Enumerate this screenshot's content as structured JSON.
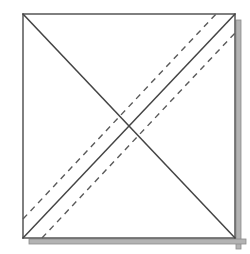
{
  "figure": {
    "name": "square-fold-diagram",
    "background_color": "#ffffff"
  },
  "canvas": {
    "width": 250,
    "height": 254
  },
  "sheet": {
    "name": "square-sheet",
    "fill_color": "#ffffff",
    "stroke_color": "#4a4a4a",
    "stroke_width": 1.4,
    "corners": {
      "top_left": {
        "x": 23,
        "y": 14
      },
      "top_right": {
        "x": 235,
        "y": 14
      },
      "bottom_right": {
        "x": 235,
        "y": 238
      },
      "bottom_left": {
        "x": 23,
        "y": 238
      }
    }
  },
  "shadow": {
    "name": "sheet-drop-shadow",
    "color": "#b3b3b3",
    "stroke_color": "#8c8c8c",
    "offset_x": 6,
    "offset_y": 6,
    "thickness": 5,
    "edges": [
      "right",
      "bottom"
    ]
  },
  "solid_lines": [
    {
      "name": "main-diagonal",
      "label": "Diagonal top-left to bottom-right",
      "from": {
        "x": 23,
        "y": 14
      },
      "to": {
        "x": 235,
        "y": 238
      },
      "color": "#444444",
      "width": 1.5,
      "style": "solid"
    },
    {
      "name": "anti-diagonal",
      "label": "Diagonal bottom-left to top-right",
      "from": {
        "x": 23,
        "y": 238
      },
      "to": {
        "x": 235,
        "y": 14
      },
      "color": "#444444",
      "width": 1.5,
      "style": "solid"
    }
  ],
  "dashed_lines": [
    {
      "name": "fold-line-upper",
      "label": "Dashed fold line above anti-diagonal",
      "from": {
        "x": 23,
        "y": 219
      },
      "to": {
        "x": 216,
        "y": 14
      },
      "color": "#5a5a5a",
      "width": 1.4,
      "style": "dashed",
      "dash_length": 6,
      "gap_length": 5,
      "offset_from_anti_diagonal": -13
    },
    {
      "name": "fold-line-lower",
      "label": "Dashed fold line below anti-diagonal",
      "from": {
        "x": 42,
        "y": 238
      },
      "to": {
        "x": 235,
        "y": 33
      },
      "color": "#5a5a5a",
      "width": 1.4,
      "style": "dashed",
      "dash_length": 6,
      "gap_length": 5,
      "offset_from_anti_diagonal": 13
    }
  ],
  "center_point": {
    "name": "diagonal-intersection",
    "x": 129,
    "y": 126
  }
}
